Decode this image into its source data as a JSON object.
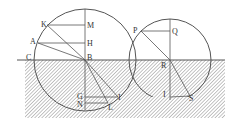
{
  "diagram": {
    "colors": {
      "line": "#555555",
      "hatch": "#8a8a8a",
      "background": "#ffffff",
      "label": "#333333"
    },
    "labels": {
      "K": "K",
      "M": "M",
      "A": "A",
      "H": "H",
      "C": "C",
      "B": "B",
      "G": "G",
      "N": "N",
      "I": "I",
      "L": "L",
      "P": "P",
      "Q": "Q",
      "R": "R",
      "T": "I",
      "S": "S"
    }
  }
}
